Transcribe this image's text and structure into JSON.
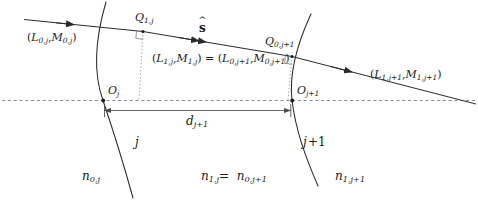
{
  "figure": {
    "kind": "optical-ray-trace-diagram"
  },
  "colors": {
    "stroke": "#2a2a2a",
    "axis": "#6d6d8c",
    "normal": "#9a9a9a",
    "text": "#1a1a1a",
    "background": "#ffffff"
  },
  "rays": {
    "incoming": {
      "label_L": "L",
      "label_M": "M",
      "sub": "0,j",
      "text": "(L0,j ,M0,j)"
    },
    "middle": {
      "text": "(L1,j ,M1,j) = (L0,j+1 ,M0,j+1)"
    },
    "outgoing": {
      "text": "(L1,j+1 ,M1,j+1)"
    },
    "direction_vector": {
      "symbol": "s",
      "accent": "hat",
      "name": "unit-direction-vector"
    }
  },
  "points": {
    "q1j": {
      "base": "Q",
      "sub": "1,j"
    },
    "q0j1": {
      "base": "Q",
      "sub": "0,j+1"
    },
    "oj": {
      "base": "O",
      "sub": "j"
    },
    "oj1": {
      "base": "O",
      "sub": "j+1"
    }
  },
  "surfaces": {
    "left": {
      "index_label": "j"
    },
    "right": {
      "index_label": "j+1"
    }
  },
  "media": {
    "left": {
      "base": "n",
      "sub": "0,j"
    },
    "middle_a": {
      "base": "n",
      "sub": "1,j"
    },
    "middle_eq": "=",
    "middle_b": {
      "base": "n",
      "sub": "0,j+1"
    },
    "right": {
      "base": "n",
      "sub": "1,j+1"
    }
  },
  "distance": {
    "base": "d",
    "sub": "j+1",
    "name": "axial-separation"
  },
  "glyphs": {
    "open_paren": "(",
    "close_paren": ")",
    "comma": ",",
    "equals": "=",
    "hat": "ˆ",
    "s": "s",
    "L": "L",
    "M": "M",
    "n": "n",
    "Q": "Q",
    "O": "O",
    "d": "d"
  }
}
